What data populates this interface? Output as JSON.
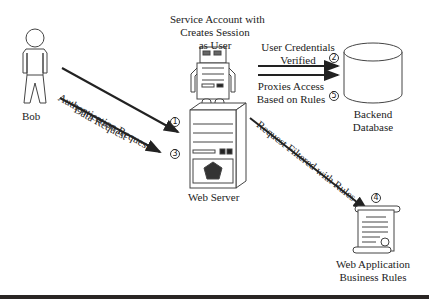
{
  "actors": {
    "bob": {
      "label": "Bob"
    },
    "service_account": {
      "label_line1": "Service Account with",
      "label_line2": "Creates Session",
      "label_line3": "as User"
    },
    "web_server": {
      "label": "Web Server"
    },
    "backend_db": {
      "label_line1": "Backend",
      "label_line2": "Database"
    },
    "business_rules": {
      "label_line1": "Web Application",
      "label_line2": "Business Rules"
    }
  },
  "flows": [
    {
      "step": "1",
      "label": "Authentication Request"
    },
    {
      "step": "2",
      "label_line1": "User Credentials",
      "label_line2": "Verified"
    },
    {
      "step": "3",
      "label": "Data Request"
    },
    {
      "step": "4",
      "label": "Request Filtered with Rules"
    },
    {
      "step": "5",
      "label_line1": "Proxies Access",
      "label_line2": "Based on Rules"
    }
  ],
  "colors": {
    "line": "#222222",
    "bottom_bar": "#2a2624"
  }
}
